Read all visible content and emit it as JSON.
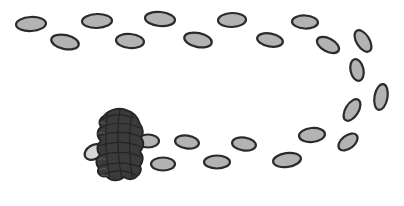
{
  "scene": {
    "description": "Path of footprints ending at a scribbled-out blob",
    "width": 404,
    "height": 206,
    "colors": {
      "background": "#ffffff",
      "footprint_fill": "#b3b3b3",
      "footprint_light_fill": "#d6d6d6",
      "footprint_stroke": "#2b2b2b",
      "scribble_fill": "#3b3b3b"
    },
    "footprints": [
      {
        "cx": 31,
        "cy": 24,
        "rx": 15,
        "ry": 7,
        "rot": -3
      },
      {
        "cx": 65,
        "cy": 42,
        "rx": 14,
        "ry": 7,
        "rot": 12
      },
      {
        "cx": 97,
        "cy": 21,
        "rx": 15,
        "ry": 7,
        "rot": -2
      },
      {
        "cx": 130,
        "cy": 41,
        "rx": 14,
        "ry": 7,
        "rot": 5
      },
      {
        "cx": 160,
        "cy": 19,
        "rx": 15,
        "ry": 7,
        "rot": 5
      },
      {
        "cx": 198,
        "cy": 40,
        "rx": 14,
        "ry": 7,
        "rot": 12
      },
      {
        "cx": 232,
        "cy": 20,
        "rx": 14,
        "ry": 7,
        "rot": -2
      },
      {
        "cx": 270,
        "cy": 40,
        "rx": 13,
        "ry": 6.5,
        "rot": 10
      },
      {
        "cx": 305,
        "cy": 22,
        "rx": 13,
        "ry": 6.5,
        "rot": 3
      },
      {
        "cx": 328,
        "cy": 45,
        "rx": 12,
        "ry": 6.5,
        "rot": 28
      },
      {
        "cx": 363,
        "cy": 41,
        "rx": 12,
        "ry": 6.5,
        "rot": 58
      },
      {
        "cx": 357,
        "cy": 70,
        "rx": 11,
        "ry": 6.5,
        "rot": 78
      },
      {
        "cx": 381,
        "cy": 97,
        "rx": 13,
        "ry": 6.5,
        "rot": -80
      },
      {
        "cx": 352,
        "cy": 110,
        "rx": 12,
        "ry": 6.5,
        "rot": -58
      },
      {
        "cx": 348,
        "cy": 142,
        "rx": 11,
        "ry": 6.5,
        "rot": -38
      },
      {
        "cx": 312,
        "cy": 135,
        "rx": 13,
        "ry": 7,
        "rot": -5
      },
      {
        "cx": 287,
        "cy": 160,
        "rx": 14,
        "ry": 7,
        "rot": -8
      },
      {
        "cx": 244,
        "cy": 144,
        "rx": 12,
        "ry": 6.5,
        "rot": 8
      },
      {
        "cx": 217,
        "cy": 162,
        "rx": 13,
        "ry": 6.5,
        "rot": 0
      },
      {
        "cx": 187,
        "cy": 142,
        "rx": 12,
        "ry": 6.5,
        "rot": 8
      },
      {
        "cx": 163,
        "cy": 164,
        "rx": 12,
        "ry": 6.5,
        "rot": 0
      },
      {
        "cx": 148,
        "cy": 141,
        "rx": 11,
        "ry": 6.5,
        "rot": 0
      }
    ],
    "hidden_footprint": {
      "cx": 94,
      "cy": 152,
      "rx": 10,
      "ry": 7,
      "rot": -30
    }
  }
}
